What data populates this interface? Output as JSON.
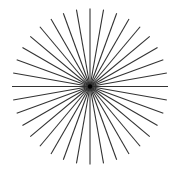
{
  "figure": {
    "kind": "radial-line-star",
    "line_count": 36,
    "angle_step_degrees": 10,
    "start_angle_degrees": 0,
    "line_color": "#333333",
    "center_dot_color": "#000000",
    "background_color": "#ffffff"
  }
}
